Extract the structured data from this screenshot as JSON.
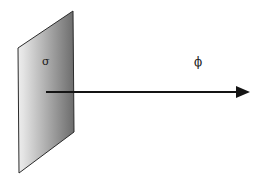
{
  "figure": {
    "background_color": "#ffffff",
    "width": 259,
    "height": 185,
    "plane": {
      "name": "charged-plane",
      "shape": "parallelogram",
      "vertices": [
        {
          "x": 73,
          "y": 11
        },
        {
          "x": 18,
          "y": 48
        },
        {
          "x": 19,
          "y": 173
        },
        {
          "x": 74,
          "y": 132
        }
      ],
      "points_attr": "73,11 18,48 19,173 74,132",
      "stroke_color": "#2b2b2b",
      "stroke_width": 1,
      "gradient": {
        "from_color": "#e8e8e8",
        "mid_color": "#bdbdbd",
        "to_color": "#6f6f6f",
        "direction": "left-to-right"
      }
    },
    "arrow": {
      "name": "flux-arrow",
      "start": {
        "x": 46,
        "y": 92
      },
      "end": {
        "x": 250,
        "y": 92
      },
      "line_end_x": 236,
      "color": "#141414",
      "stroke_width": 2,
      "head": {
        "points_attr": "236,86 250,92 236,98",
        "length": 14,
        "half_width": 6
      }
    },
    "labels": {
      "sigma": {
        "text": "σ",
        "x": 47,
        "y": 62,
        "color": "#1a1a1a",
        "meaning": "surface-charge-density"
      },
      "phi": {
        "text": "ϕ",
        "x": 199,
        "y": 62,
        "color": "#1a1a1a",
        "meaning": "electric-flux"
      }
    }
  }
}
